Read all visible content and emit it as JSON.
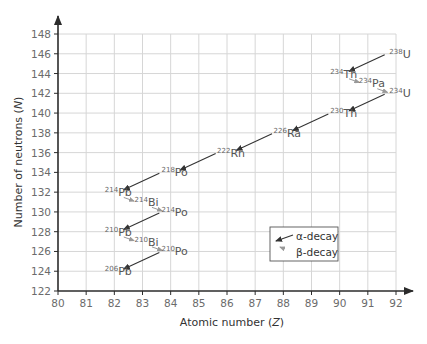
{
  "chart_data": {
    "type": "scatter",
    "xlabel": "Atomic number (Z)",
    "ylabel": "Number of neutrons (N)",
    "xlim": [
      80,
      92
    ],
    "ylim": [
      122,
      148
    ],
    "xticks": [
      80,
      81,
      82,
      83,
      84,
      85,
      86,
      87,
      88,
      89,
      90,
      91,
      92
    ],
    "yticks": [
      122,
      124,
      126,
      128,
      130,
      132,
      134,
      136,
      138,
      140,
      142,
      144,
      146,
      148
    ],
    "grid": true,
    "legend_position": "lower right",
    "legend": [
      {
        "label": "α-decay",
        "style": "dark arrow"
      },
      {
        "label": "β-decay",
        "style": "light arrow"
      }
    ],
    "nuclides": [
      {
        "mass": "238",
        "symbol": "U",
        "Z": 92,
        "N": 146
      },
      {
        "mass": "234",
        "symbol": "Th",
        "Z": 90,
        "N": 144
      },
      {
        "mass": "234",
        "symbol": "Pa",
        "Z": 91,
        "N": 143
      },
      {
        "mass": "234",
        "symbol": "U",
        "Z": 92,
        "N": 142
      },
      {
        "mass": "230",
        "symbol": "Th",
        "Z": 90,
        "N": 140
      },
      {
        "mass": "226",
        "symbol": "Ra",
        "Z": 88,
        "N": 138
      },
      {
        "mass": "222",
        "symbol": "Rn",
        "Z": 86,
        "N": 136
      },
      {
        "mass": "218",
        "symbol": "Po",
        "Z": 84,
        "N": 134
      },
      {
        "mass": "214",
        "symbol": "Pb",
        "Z": 82,
        "N": 132
      },
      {
        "mass": "214",
        "symbol": "Bi",
        "Z": 83,
        "N": 131
      },
      {
        "mass": "214",
        "symbol": "Po",
        "Z": 84,
        "N": 130
      },
      {
        "mass": "210",
        "symbol": "Pb",
        "Z": 82,
        "N": 128
      },
      {
        "mass": "210",
        "symbol": "Bi",
        "Z": 83,
        "N": 127
      },
      {
        "mass": "210",
        "symbol": "Po",
        "Z": 84,
        "N": 126
      },
      {
        "mass": "206",
        "symbol": "Pb",
        "Z": 82,
        "N": 124
      }
    ],
    "decays": [
      {
        "type": "alpha",
        "from": [
          92,
          146
        ],
        "to": [
          90,
          144
        ]
      },
      {
        "type": "beta",
        "from": [
          90,
          144
        ],
        "to": [
          91,
          143
        ]
      },
      {
        "type": "beta",
        "from": [
          91,
          143
        ],
        "to": [
          92,
          142
        ]
      },
      {
        "type": "alpha",
        "from": [
          92,
          142
        ],
        "to": [
          90,
          140
        ]
      },
      {
        "type": "alpha",
        "from": [
          90,
          140
        ],
        "to": [
          88,
          138
        ]
      },
      {
        "type": "alpha",
        "from": [
          88,
          138
        ],
        "to": [
          86,
          136
        ]
      },
      {
        "type": "alpha",
        "from": [
          86,
          136
        ],
        "to": [
          84,
          134
        ]
      },
      {
        "type": "alpha",
        "from": [
          84,
          134
        ],
        "to": [
          82,
          132
        ]
      },
      {
        "type": "beta",
        "from": [
          82,
          132
        ],
        "to": [
          83,
          131
        ]
      },
      {
        "type": "beta",
        "from": [
          83,
          131
        ],
        "to": [
          84,
          130
        ]
      },
      {
        "type": "alpha",
        "from": [
          84,
          130
        ],
        "to": [
          82,
          128
        ]
      },
      {
        "type": "beta",
        "from": [
          82,
          128
        ],
        "to": [
          83,
          127
        ]
      },
      {
        "type": "beta",
        "from": [
          83,
          127
        ],
        "to": [
          84,
          126
        ]
      },
      {
        "type": "alpha",
        "from": [
          84,
          126
        ],
        "to": [
          82,
          124
        ]
      }
    ]
  }
}
